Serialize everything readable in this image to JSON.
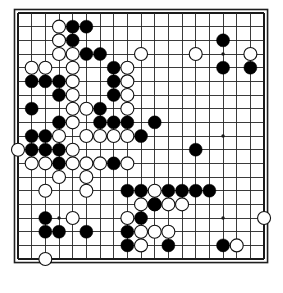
{
  "app": {
    "title": "Go Board Position",
    "board_type": "go-board",
    "size": 19
  },
  "board": {
    "origin_x": 18,
    "origin_y": 13,
    "spacing": 13.67,
    "lines": 19,
    "stone_radius": 6.5,
    "colors": {
      "background": "#ffffff",
      "line": "#262626",
      "border": "#1f1f1f",
      "black_stone": "#000000",
      "white_stone": "#ffffff",
      "white_stone_outline": "#111111",
      "hoshi": "#1a1a1a"
    },
    "hoshi_points": [
      [
        4,
        4
      ],
      [
        10,
        4
      ],
      [
        16,
        4
      ],
      [
        4,
        10
      ],
      [
        10,
        10
      ],
      [
        16,
        10
      ],
      [
        4,
        16
      ],
      [
        10,
        16
      ],
      [
        16,
        16
      ]
    ],
    "black_stones": [
      [
        6,
        2
      ],
      [
        5,
        3
      ],
      [
        6,
        4
      ],
      [
        7,
        4
      ],
      [
        8,
        5
      ],
      [
        2,
        6
      ],
      [
        3,
        6
      ],
      [
        4,
        6
      ],
      [
        8,
        6
      ],
      [
        4,
        7
      ],
      [
        8,
        7
      ],
      [
        2,
        8
      ],
      [
        7,
        8
      ],
      [
        4,
        9
      ],
      [
        7,
        9
      ],
      [
        8,
        9
      ],
      [
        9,
        9
      ],
      [
        11,
        9
      ],
      [
        2,
        10
      ],
      [
        3,
        10
      ],
      [
        10,
        10
      ],
      [
        2,
        11
      ],
      [
        3,
        11
      ],
      [
        4,
        11
      ],
      [
        4,
        12
      ],
      [
        8,
        12
      ],
      [
        14,
        11
      ],
      [
        9,
        14
      ],
      [
        10,
        14
      ],
      [
        12,
        14
      ],
      [
        13,
        14
      ],
      [
        14,
        14
      ],
      [
        15,
        14
      ],
      [
        11,
        15
      ],
      [
        3,
        16
      ],
      [
        10,
        16
      ],
      [
        3,
        17
      ],
      [
        4,
        17
      ],
      [
        6,
        17
      ],
      [
        9,
        17
      ],
      [
        9,
        18
      ],
      [
        12,
        18
      ],
      [
        16,
        18
      ],
      [
        16,
        3
      ],
      [
        16,
        5
      ],
      [
        18,
        5
      ],
      [
        5,
        2
      ]
    ],
    "white_stones": [
      [
        4,
        2
      ],
      [
        4,
        3
      ],
      [
        4,
        4
      ],
      [
        5,
        4
      ],
      [
        10,
        4
      ],
      [
        14,
        4
      ],
      [
        18,
        4
      ],
      [
        2,
        5
      ],
      [
        3,
        5
      ],
      [
        5,
        5
      ],
      [
        9,
        5
      ],
      [
        5,
        6
      ],
      [
        9,
        6
      ],
      [
        5,
        7
      ],
      [
        9,
        7
      ],
      [
        5,
        8
      ],
      [
        6,
        8
      ],
      [
        9,
        8
      ],
      [
        5,
        9
      ],
      [
        4,
        10
      ],
      [
        6,
        10
      ],
      [
        7,
        10
      ],
      [
        8,
        10
      ],
      [
        9,
        10
      ],
      [
        1,
        11
      ],
      [
        5,
        11
      ],
      [
        2,
        12
      ],
      [
        3,
        12
      ],
      [
        5,
        12
      ],
      [
        6,
        12
      ],
      [
        7,
        12
      ],
      [
        9,
        12
      ],
      [
        4,
        13
      ],
      [
        6,
        13
      ],
      [
        3,
        14
      ],
      [
        6,
        14
      ],
      [
        11,
        14
      ],
      [
        10,
        15
      ],
      [
        11,
        15
      ],
      [
        12,
        15
      ],
      [
        13,
        15
      ],
      [
        5,
        16
      ],
      [
        9,
        16
      ],
      [
        10,
        17
      ],
      [
        11,
        17
      ],
      [
        12,
        17
      ],
      [
        19,
        16
      ],
      [
        10,
        18
      ],
      [
        17,
        18
      ],
      [
        3,
        19
      ]
    ]
  }
}
